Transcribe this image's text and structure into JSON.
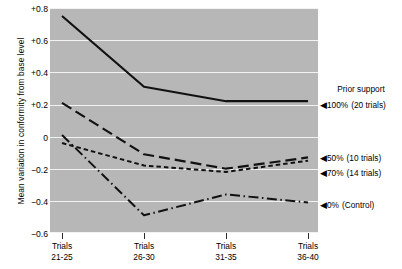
{
  "chart_data": {
    "type": "line",
    "title": "",
    "xlabel": "",
    "ylabel": "Mean variation in conformity from base level",
    "categories": [
      "Trials 21-25",
      "Trials 26-30",
      "Trials 31-35",
      "Trials 36-40"
    ],
    "category_lines": [
      {
        "top": "Trials",
        "bottom": "21-25"
      },
      {
        "top": "Trials",
        "bottom": "26-30"
      },
      {
        "top": "Trials",
        "bottom": "31-35"
      },
      {
        "top": "Trials",
        "bottom": "36-40"
      }
    ],
    "ylim": [
      -0.6,
      0.8
    ],
    "yticks": [
      0.8,
      0.6,
      0.4,
      0.2,
      0,
      -0.2,
      -0.4,
      -0.6
    ],
    "ytick_labels": [
      "+0.8",
      "+0.6",
      "+0.4",
      "+0.2",
      "0",
      "−0.2",
      "−0.4",
      "−0.6"
    ],
    "grid": true,
    "grid_color": "#f2f2f2",
    "plot_background": "#b7b7b7",
    "legend_position": "right",
    "legend_title": "Prior support",
    "series": [
      {
        "name": "100% (20 trials)",
        "percent": "100%",
        "detail": "(20 trials)",
        "style": "solid",
        "values": [
          0.75,
          0.31,
          0.22,
          0.22
        ]
      },
      {
        "name": "50% (10 trials)",
        "percent": "50%",
        "detail": "(10 trials)",
        "style": "long-dash",
        "values": [
          0.21,
          -0.11,
          -0.2,
          -0.13
        ]
      },
      {
        "name": "70% (14 trials)",
        "percent": "70%",
        "detail": "(14 trials)",
        "style": "short-dash",
        "values": [
          -0.04,
          -0.18,
          -0.22,
          -0.15
        ]
      },
      {
        "name": "0% (Control)",
        "percent": "0%",
        "detail": "(Control)",
        "style": "dash-dot",
        "values": [
          0.01,
          -0.49,
          -0.36,
          -0.41
        ]
      }
    ],
    "legend_marker": "◀"
  }
}
